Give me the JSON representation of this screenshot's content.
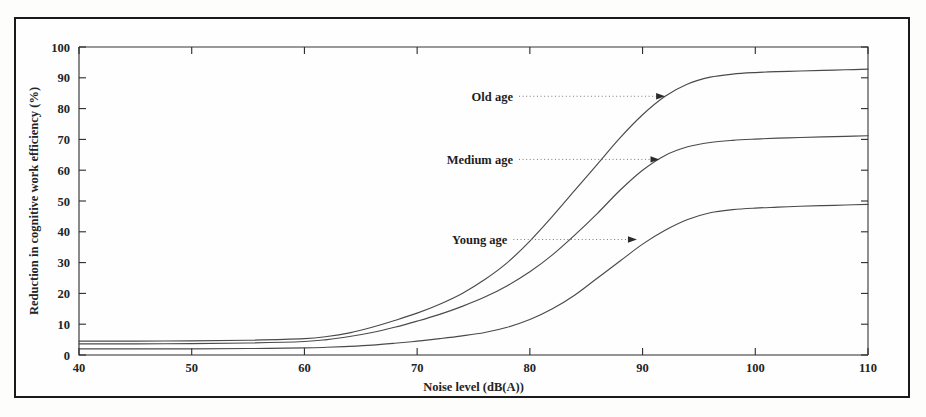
{
  "figure": {
    "background_color": "#fdfdfc",
    "frame_color": "#1a1a1a",
    "curve_color": "#4a4a4a",
    "axis_color": "#2b2b2b",
    "text_color": "#242424"
  },
  "chart_data": {
    "type": "line",
    "title": "",
    "xlabel": "Noise level (dB(A))",
    "ylabel": "Reduction in cognitive work efficiency (%)",
    "xlim": [
      40,
      110
    ],
    "ylim": [
      0,
      100
    ],
    "xticks": [
      40,
      50,
      60,
      70,
      80,
      90,
      100,
      110
    ],
    "xtick_labels": [
      "40",
      "50",
      "60",
      "70",
      "80",
      "90",
      "100",
      "110"
    ],
    "yticks": [
      0,
      10,
      20,
      30,
      40,
      50,
      60,
      70,
      80,
      90,
      100
    ],
    "ytick_labels": [
      "0",
      "10",
      "20",
      "30",
      "40",
      "50",
      "60",
      "70",
      "80",
      "90",
      "100"
    ],
    "grid": false,
    "legend_position": "inline-annotations",
    "x": [
      40,
      45,
      50,
      55,
      60,
      62,
      64,
      66,
      68,
      70,
      72,
      74,
      76,
      78,
      80,
      82,
      84,
      86,
      88,
      90,
      92,
      94,
      96,
      98,
      100,
      102,
      104,
      106,
      108,
      110
    ],
    "series": [
      {
        "name": "Old age",
        "label": "Old age",
        "values": [
          4.5,
          4.5,
          4.6,
          4.8,
          5.3,
          6.0,
          7.2,
          9.0,
          11.2,
          13.6,
          16.5,
          20.0,
          24.5,
          30.0,
          37.0,
          45.0,
          53.5,
          62.0,
          70.5,
          78.0,
          84.0,
          88.0,
          90.2,
          91.2,
          91.7,
          92.0,
          92.2,
          92.4,
          92.6,
          92.8
        ],
        "annotation": {
          "text": "Old age",
          "label_x": 78.5,
          "label_y": 84,
          "arrow_x": 92.0,
          "arrow_y": 84
        }
      },
      {
        "name": "Medium age",
        "label": "Medium age",
        "values": [
          3.6,
          3.6,
          3.7,
          3.9,
          4.4,
          5.0,
          6.0,
          7.3,
          9.0,
          11.0,
          13.2,
          15.8,
          18.8,
          22.5,
          27.0,
          32.5,
          39.0,
          46.0,
          53.5,
          60.0,
          64.8,
          67.6,
          69.0,
          69.7,
          70.1,
          70.4,
          70.6,
          70.8,
          71.0,
          71.2
        ],
        "annotation": {
          "text": "Medium age",
          "label_x": 78.5,
          "label_y": 63.5,
          "arrow_x": 91.5,
          "arrow_y": 63.5
        }
      },
      {
        "name": "Young age",
        "label": "Young age",
        "values": [
          2.0,
          2.0,
          2.0,
          2.1,
          2.3,
          2.5,
          2.8,
          3.2,
          3.8,
          4.5,
          5.3,
          6.2,
          7.3,
          9.0,
          11.5,
          15.0,
          19.5,
          25.0,
          30.5,
          36.0,
          40.5,
          44.0,
          46.2,
          47.2,
          47.7,
          48.0,
          48.3,
          48.5,
          48.7,
          48.9
        ],
        "annotation": {
          "text": "Young age",
          "label_x": 78.0,
          "label_y": 37.5,
          "arrow_x": 89.5,
          "arrow_y": 37.5
        }
      }
    ]
  }
}
